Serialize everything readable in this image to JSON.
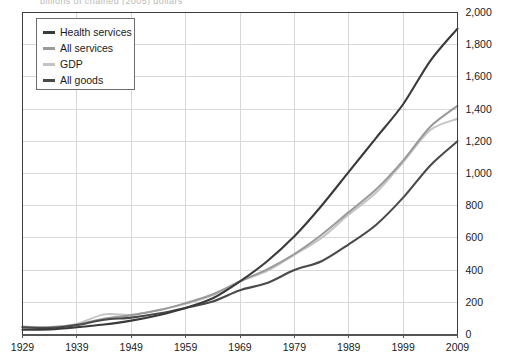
{
  "figure": {
    "cropped_header_text": "billions of chained (2005) dollars",
    "background_color": "#ffffff",
    "frame_color": "#3d3d3d",
    "grid_color": "#d8d8d8"
  },
  "legend": {
    "position": "top-left-inside",
    "border_color": "#6d6d6d",
    "entries": [
      {
        "label": "Health services",
        "color": "#3a3a3a",
        "swatch": "legend-swatch-health-services"
      },
      {
        "label": "All services",
        "color": "#9a9a9a",
        "swatch": "legend-swatch-all-services"
      },
      {
        "label": "GDP",
        "color": "#c4c4c4",
        "swatch": "legend-swatch-gdp"
      },
      {
        "label": "All goods",
        "color": "#4a4a4a",
        "swatch": "legend-swatch-all-goods"
      }
    ]
  },
  "axes": {
    "y_labels": [
      "2,000",
      "1,800",
      "1,600",
      "1,400",
      "1,200",
      "1,000",
      "800",
      "600",
      "400",
      "200",
      "0"
    ],
    "y_label_position": "right",
    "x_labels": [
      "1929",
      "1939",
      "1949",
      "1959",
      "1969",
      "1979",
      "1989",
      "1999",
      "2009"
    ]
  },
  "chart_data": {
    "type": "line",
    "title": "",
    "subtitle": "",
    "xlabel": "",
    "ylabel": "",
    "ylim": [
      0,
      2000
    ],
    "xlim": [
      1929,
      2009
    ],
    "ytick_step": 200,
    "xtick_step": 10,
    "grid": true,
    "legend_position": "upper left",
    "x": [
      1929,
      1934,
      1939,
      1944,
      1949,
      1954,
      1959,
      1964,
      1969,
      1974,
      1979,
      1984,
      1989,
      1994,
      1999,
      2004,
      2009
    ],
    "series": [
      {
        "name": "Health services",
        "color": "#3a3a3a",
        "values": [
          30,
          32,
          45,
          62,
          86,
          120,
          165,
          225,
          330,
          455,
          610,
          800,
          1010,
          1220,
          1430,
          1700,
          1900
        ]
      },
      {
        "name": "All services",
        "color": "#9a9a9a",
        "values": [
          48,
          46,
          62,
          98,
          120,
          150,
          195,
          250,
          330,
          405,
          500,
          620,
          760,
          900,
          1080,
          1290,
          1420
        ]
      },
      {
        "name": "GDP",
        "color": "#c4c4c4",
        "values": [
          50,
          44,
          66,
          125,
          122,
          152,
          190,
          245,
          330,
          395,
          495,
          600,
          745,
          880,
          1070,
          1270,
          1340
        ]
      },
      {
        "name": "All goods",
        "color": "#4a4a4a",
        "values": [
          45,
          40,
          58,
          92,
          105,
          130,
          165,
          205,
          275,
          320,
          400,
          455,
          560,
          680,
          850,
          1050,
          1200
        ]
      }
    ]
  }
}
